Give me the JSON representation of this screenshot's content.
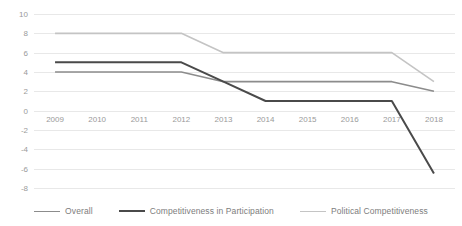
{
  "chart_data": {
    "type": "line",
    "title": "",
    "subtitle": "",
    "xlabel": "",
    "ylabel": "",
    "categories": [
      "2009",
      "2010",
      "2011",
      "2012",
      "2013",
      "2014",
      "2015",
      "2016",
      "2017",
      "2018"
    ],
    "x": [
      2009,
      2010,
      2011,
      2012,
      2013,
      2014,
      2015,
      2016,
      2017,
      2018
    ],
    "ylim": [
      -8,
      10
    ],
    "ytick_labels": [
      "10",
      "8",
      "6",
      "4",
      "2",
      "0",
      "-2",
      "-4",
      "-6",
      "-8"
    ],
    "yticks": [
      10,
      8,
      6,
      4,
      2,
      0,
      -2,
      -4,
      -6,
      -8
    ],
    "grid": true,
    "legend_position": "bottom",
    "series": [
      {
        "name": "Overall",
        "color": "#8c8c8c",
        "width": 1.6,
        "values": [
          4,
          4,
          4,
          4,
          3,
          3,
          3,
          3,
          3,
          2
        ]
      },
      {
        "name": "Competitiveness in Participation",
        "color": "#4a4a4a",
        "width": 2.0,
        "values": [
          5,
          5,
          5,
          5,
          3,
          1,
          1,
          1,
          1,
          -6.5
        ]
      },
      {
        "name": "Political Competitiveness",
        "color": "#c4c4c4",
        "width": 1.6,
        "values": [
          8,
          8,
          8,
          8,
          6,
          6,
          6,
          6,
          6,
          3
        ]
      }
    ]
  },
  "legend": {
    "items": [
      {
        "label": "Overall"
      },
      {
        "label": "Competitiveness in Participation"
      },
      {
        "label": "Political Competitiveness"
      }
    ]
  }
}
